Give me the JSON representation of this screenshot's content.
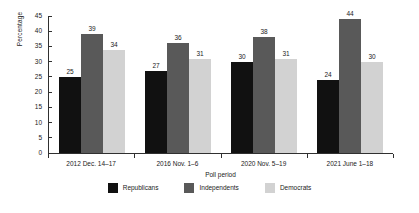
{
  "chart_data": {
    "type": "bar",
    "title": "",
    "xlabel": "Poll period",
    "ylabel": "Percentage",
    "categories": [
      "2012 Dec. 14–17",
      "2016 Nov. 1–6",
      "2020 Nov. 5–19",
      "2021 June 1–18"
    ],
    "series": [
      {
        "name": "Republicans",
        "color": "#111111",
        "values": [
          25,
          27,
          30,
          24
        ]
      },
      {
        "name": "Independents",
        "color": "#595959",
        "values": [
          39,
          36,
          38,
          44
        ]
      },
      {
        "name": "Democrats",
        "color": "#d2d2d2",
        "values": [
          34,
          31,
          31,
          30
        ]
      }
    ],
    "ylim": [
      0,
      45
    ],
    "yticks": [
      0,
      5,
      10,
      15,
      20,
      25,
      30,
      35,
      40,
      45
    ],
    "ytick_labels": [
      "0",
      "5",
      "10",
      "15",
      "20",
      "25",
      "30",
      "35",
      "40",
      "45"
    ],
    "grid": false,
    "legend_position": "bottom",
    "data_labels": true
  }
}
